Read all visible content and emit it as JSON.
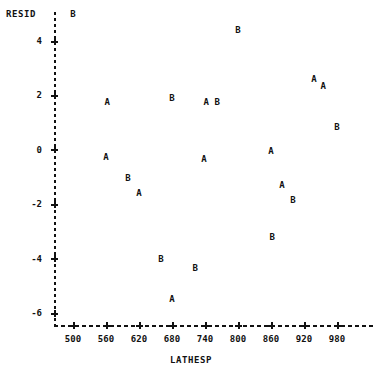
{
  "chart_data": {
    "type": "scatter",
    "title": "",
    "subtitle": "",
    "xlabel": "LATHESP",
    "ylabel": "RESID",
    "xlim": [
      470,
      1000
    ],
    "ylim": [
      -6.6,
      5.4
    ],
    "grid": false,
    "legend_position": "none",
    "point_label_meaning": "Plot character denotes group: A or B",
    "xticks": [
      500,
      560,
      620,
      680,
      740,
      800,
      860,
      920,
      980
    ],
    "yticks": [
      4,
      2,
      0,
      -2,
      -4,
      -6
    ],
    "ytick_labels": [
      "4",
      "2",
      "0",
      "-2",
      "-4",
      "-6"
    ],
    "xtick_labels": [
      "500",
      "560",
      "620",
      "680",
      "740",
      "800",
      "860",
      "920",
      "980"
    ],
    "series": [
      {
        "name": "A",
        "marker": "A",
        "points": [
          {
            "x": 562,
            "y": 1.75
          },
          {
            "x": 560,
            "y": -0.25
          },
          {
            "x": 620,
            "y": -1.6
          },
          {
            "x": 742,
            "y": 1.75
          },
          {
            "x": 738,
            "y": -0.35
          },
          {
            "x": 860,
            "y": -0.05
          },
          {
            "x": 880,
            "y": -1.3
          },
          {
            "x": 680,
            "y": -5.5
          },
          {
            "x": 938,
            "y": 2.6
          },
          {
            "x": 955,
            "y": 2.35
          }
        ]
      },
      {
        "name": "B",
        "marker": "B",
        "points": [
          {
            "x": 500,
            "y": 5.0
          },
          {
            "x": 680,
            "y": 1.9
          },
          {
            "x": 762,
            "y": 1.75
          },
          {
            "x": 800,
            "y": 4.4
          },
          {
            "x": 600,
            "y": -1.05
          },
          {
            "x": 980,
            "y": 0.85
          },
          {
            "x": 900,
            "y": -1.85
          },
          {
            "x": 862,
            "y": -3.2
          },
          {
            "x": 660,
            "y": -4.0
          },
          {
            "x": 722,
            "y": -4.35
          }
        ]
      }
    ],
    "all_points": [
      {
        "x": 500,
        "y": 5.0,
        "label": "B"
      },
      {
        "x": 800,
        "y": 4.4,
        "label": "B"
      },
      {
        "x": 938,
        "y": 2.6,
        "label": "A"
      },
      {
        "x": 955,
        "y": 2.35,
        "label": "A"
      },
      {
        "x": 680,
        "y": 1.9,
        "label": "B"
      },
      {
        "x": 562,
        "y": 1.75,
        "label": "A"
      },
      {
        "x": 742,
        "y": 1.75,
        "label": "A"
      },
      {
        "x": 762,
        "y": 1.75,
        "label": "B"
      },
      {
        "x": 980,
        "y": 0.85,
        "label": "B"
      },
      {
        "x": 560,
        "y": -0.25,
        "label": "A"
      },
      {
        "x": 738,
        "y": -0.35,
        "label": "A"
      },
      {
        "x": 860,
        "y": -0.05,
        "label": "A"
      },
      {
        "x": 600,
        "y": -1.05,
        "label": "B"
      },
      {
        "x": 880,
        "y": -1.3,
        "label": "A"
      },
      {
        "x": 620,
        "y": -1.6,
        "label": "A"
      },
      {
        "x": 900,
        "y": -1.85,
        "label": "B"
      },
      {
        "x": 862,
        "y": -3.2,
        "label": "B"
      },
      {
        "x": 660,
        "y": -4.0,
        "label": "B"
      },
      {
        "x": 722,
        "y": -4.35,
        "label": "B"
      },
      {
        "x": 680,
        "y": -5.5,
        "label": "A"
      }
    ]
  }
}
